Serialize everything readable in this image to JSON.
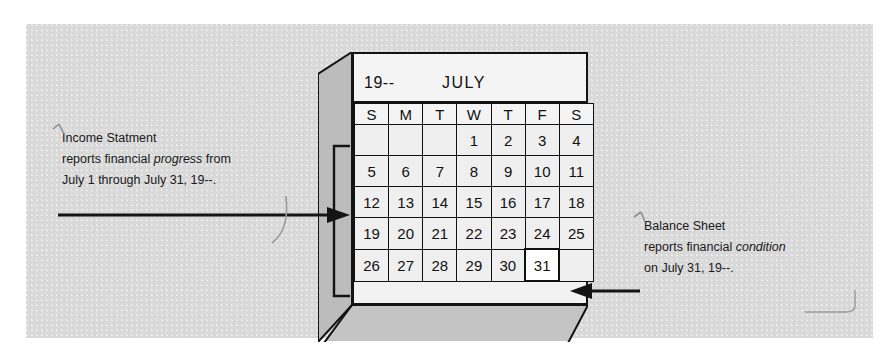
{
  "figure": {
    "kind": "accounting-textbook-illustration",
    "background_color": "#ffffff",
    "panel_color": "#d9d9d9"
  },
  "calendar": {
    "year_label": "19--",
    "month_label": "JULY",
    "weekday_headers": [
      "S",
      "M",
      "T",
      "W",
      "T",
      "F",
      "S"
    ],
    "weeks": [
      [
        "",
        "",
        "",
        "1",
        "2",
        "3",
        "4"
      ],
      [
        "5",
        "6",
        "7",
        "8",
        "9",
        "10",
        "11"
      ],
      [
        "12",
        "13",
        "14",
        "15",
        "16",
        "17",
        "18"
      ],
      [
        "19",
        "20",
        "21",
        "22",
        "23",
        "24",
        "25"
      ],
      [
        "26",
        "27",
        "28",
        "29",
        "30",
        "31",
        ""
      ]
    ],
    "highlighted_day": "31",
    "face_color": "#f2f2f2",
    "side_color": "#bcbcbc",
    "highlight_color": "#ffffff",
    "line_color": "#131313"
  },
  "annotations": {
    "income_statement": {
      "title": "Income Statment",
      "line2_pre": "reports financial ",
      "line2_em": "progress",
      "line2_post": " from",
      "line3": "July 1 through July 31, 19--.",
      "points_to": "entire month of July (July 1 through July 31)"
    },
    "balance_sheet": {
      "title": "Balance Sheet",
      "line2_pre": "reports financial ",
      "line2_em": "condition",
      "line2_post": "",
      "line3": "on July 31, 19--.",
      "points_to": "July 31 cell"
    }
  },
  "icons": {
    "arrow_right": "arrow-right-icon",
    "arrow_left": "arrow-left-icon",
    "range_bracket": "range-bracket-icon"
  }
}
